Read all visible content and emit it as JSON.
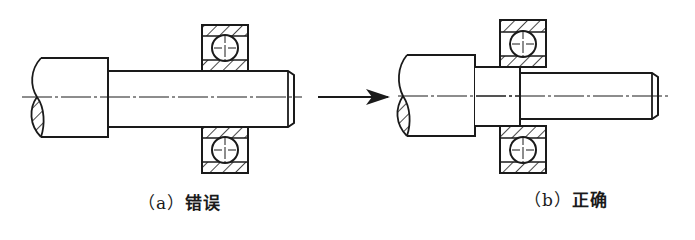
{
  "figure": {
    "colors": {
      "stroke": "#1a1a1a",
      "background": "#ffffff"
    },
    "panels": [
      {
        "id": "a",
        "caption_tag": "（a）",
        "caption_word": "错误",
        "meaning": "wrong"
      },
      {
        "id": "b",
        "caption_tag": "（b）",
        "caption_word": "正确",
        "meaning": "correct"
      }
    ],
    "arrow": {
      "direction": "right"
    }
  }
}
